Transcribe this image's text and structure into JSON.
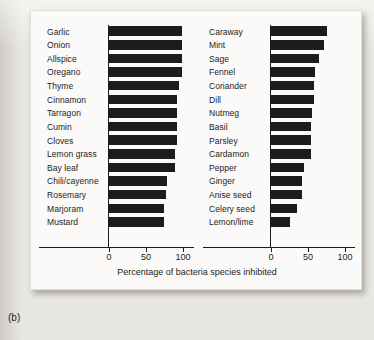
{
  "figure": {
    "caption": "(b)",
    "axis_label": "Percentage of bacteria species inhibited",
    "bar_color": "#1c1c1c",
    "card_color": "#fbfaf8",
    "page_color": "#e9e7e2"
  },
  "axis": {
    "ticks": [
      "0",
      "50",
      "100"
    ],
    "tick_values": [
      0,
      50,
      100
    ],
    "min": 0,
    "max": 100
  },
  "chart_data": {
    "type": "bar",
    "orientation": "horizontal",
    "title": "",
    "subtitle": "",
    "xlabel": "Percentage of bacteria species inhibited",
    "ylabel": "",
    "xlim": [
      0,
      100
    ],
    "grid": false,
    "legend": null,
    "panels": [
      {
        "name": "left-panel",
        "categories": [
          "Garlic",
          "Onion",
          "Allspice",
          "Oregano",
          "Thyme",
          "Cinnamon",
          "Tarragon",
          "Cumin",
          "Cloves",
          "Lemon grass",
          "Bay leaf",
          "Chili/cayenne",
          "Rosemary",
          "Marjoram",
          "Mustard"
        ],
        "values": [
          100,
          100,
          100,
          100,
          96,
          93,
          93,
          93,
          93,
          91,
          90,
          80,
          78,
          76,
          76
        ]
      },
      {
        "name": "right-panel",
        "categories": [
          "Caraway",
          "Mint",
          "Sage",
          "Fennel",
          "Coriander",
          "Dill",
          "Nutmeg",
          "Basil",
          "Parsley",
          "Cardamon",
          "Pepper",
          "Ginger",
          "Anise seed",
          "Celery seed",
          "Lemon/lime"
        ],
        "values": [
          77,
          73,
          66,
          61,
          60,
          59,
          57,
          56,
          55,
          55,
          46,
          43,
          43,
          37,
          27
        ]
      }
    ]
  }
}
